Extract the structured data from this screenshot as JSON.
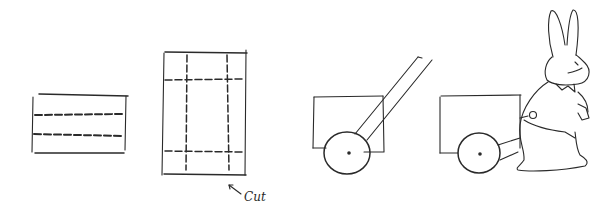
{
  "illustration": {
    "style": "hand-drawn pencil sketch",
    "ink_color": "#2a2a2a",
    "background": "#ffffff",
    "panels": [
      {
        "id": "folded-sheet",
        "description": "rectangle with two dashed fold lines"
      },
      {
        "id": "cut-pattern",
        "description": "tall rectangle with dashed cut/fold grid",
        "annotation": "Cut"
      },
      {
        "id": "cart-with-handle",
        "description": "box cart with wheel and long handle"
      },
      {
        "id": "rabbit-pulling-cart",
        "description": "rabbit in vest with bow tie pulling the cart"
      }
    ]
  },
  "annotations": {
    "cut_label": "Cut"
  }
}
